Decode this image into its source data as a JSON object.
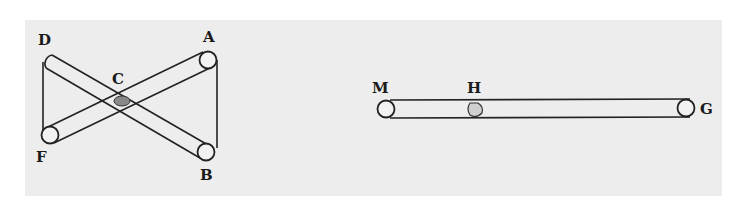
{
  "figure": {
    "left_diagram": {
      "description": "Two crossed rollers/bars pivoting at C, with ends D, A, F, B",
      "labels": {
        "D": "D",
        "A": "A",
        "C": "C",
        "F": "F",
        "B": "B"
      }
    },
    "right_diagram": {
      "description": "Single horizontal roller/bar from M to G with point H",
      "labels": {
        "M": "M",
        "H": "H",
        "G": "G"
      }
    }
  },
  "colors": {
    "background": "#ededed",
    "ink": "#222222",
    "page": "#ffffff"
  }
}
